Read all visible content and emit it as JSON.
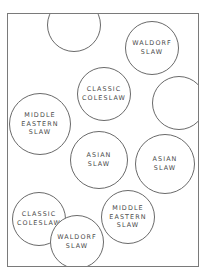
{
  "diagram": {
    "type": "seating/label circles",
    "circles": [
      {
        "id": "a",
        "lines": [],
        "cx": 73,
        "cy": 34,
        "r": 27
      },
      {
        "id": "b",
        "lines": [
          "WALDORF",
          "SLAW"
        ],
        "cx": 151,
        "cy": 47,
        "r": 27
      },
      {
        "id": "c",
        "lines": [
          "CLASSIC",
          "COLESLAW"
        ],
        "cx": 103,
        "cy": 93,
        "r": 27
      },
      {
        "id": "d",
        "lines": [],
        "cx": 178,
        "cy": 102,
        "r": 27
      },
      {
        "id": "e",
        "lines": [
          "MIDDLE",
          "EASTERN",
          "SLAW"
        ],
        "cx": 39,
        "cy": 123,
        "r": 31
      },
      {
        "id": "f",
        "lines": [
          "ASIAN",
          "SLAW"
        ],
        "cx": 98,
        "cy": 159,
        "r": 29
      },
      {
        "id": "g",
        "lines": [
          "ASIAN",
          "SLAW"
        ],
        "cx": 164,
        "cy": 163,
        "r": 30
      },
      {
        "id": "h",
        "lines": [
          "CLASSIC",
          "COLESLAW"
        ],
        "cx": 38,
        "cy": 218,
        "r": 27
      },
      {
        "id": "i",
        "lines": [
          "MIDDLE",
          "EASTERN",
          "SLAW"
        ],
        "cx": 127,
        "cy": 216,
        "r": 27
      },
      {
        "id": "j",
        "lines": [
          "WALDORF",
          "SLAW"
        ],
        "cx": 76,
        "cy": 241,
        "r": 27
      }
    ]
  },
  "colors": {
    "stroke": "#6a6a6a",
    "text": "#4a4a4a",
    "frame": "#7a7a7a"
  }
}
